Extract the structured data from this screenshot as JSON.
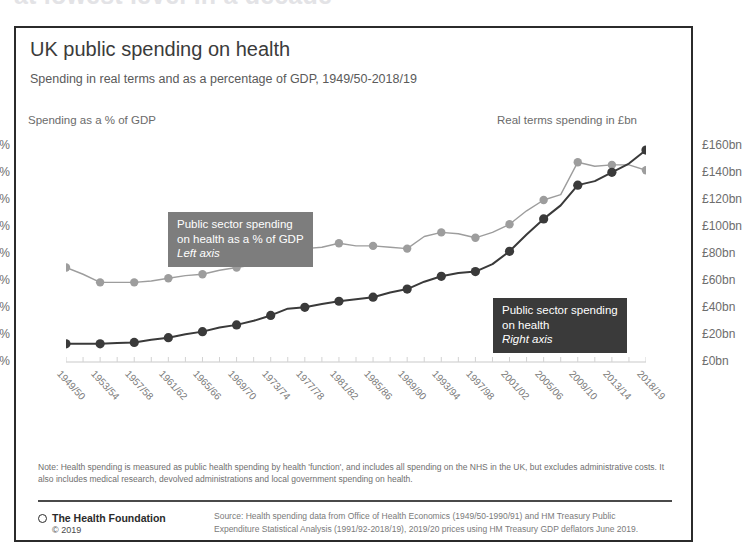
{
  "headline": "at lowest level in a decade",
  "card": {
    "title": "UK public spending on health",
    "subtitle": "Spending in real terms and as a percentage of GDP, 1949/50-2018/19",
    "left_axis_caption": "Spending as a % of GDP",
    "right_axis_caption": "Real terms spending in £bn",
    "callouts": {
      "gdp": {
        "line1": "Public sector spending",
        "line2": "on health as a % of GDP",
        "axis_note": "Left axis",
        "color": "#7d7d7d"
      },
      "real": {
        "line1": "Public sector spending",
        "line2": "on health",
        "axis_note": "Right axis",
        "color": "#3a3a3a"
      }
    },
    "note": "Note: Health spending is measured as public health spending by health 'function', and includes all spending on the NHS in the UK, but excludes administrative costs. It also includes medical research, devolved administrations and local government spending on health.",
    "brand": "The Health Foundation",
    "copyright": "© 2019",
    "source": "Source: Health spending data from Office of Health Economics (1949/50-1990/91) and HM Treasury Public Expenditure Statistical Analysis (1991/92-2018/19), 2019/20 prices using HM Treasury GDP deflators June 2019."
  },
  "chart_data": {
    "type": "line",
    "title": "UK public spending on health",
    "subtitle": "Spending in real terms and as a percentage of GDP, 1949/50-2018/19",
    "xlabel": "",
    "ylabel": "Spending as a % of GDP",
    "y2label": "Real terms spending in £bn",
    "grid": false,
    "legend_position": "inline-callout",
    "ylim": [
      0,
      8
    ],
    "y2lim": [
      0,
      160
    ],
    "yticks": [
      "0%",
      "1%",
      "2%",
      "3%",
      "4%",
      "5%",
      "6%",
      "7%",
      "8%"
    ],
    "y2ticks": [
      "£0bn",
      "£20bn",
      "£40bn",
      "£60bn",
      "£80bn",
      "£100bn",
      "£120bn",
      "£140bn",
      "£160bn"
    ],
    "xtick_labels": [
      "1949/50",
      "1953/54",
      "1957/58",
      "1961/62",
      "1965/66",
      "1969/70",
      "1973/74",
      "1977/78",
      "1981/82",
      "1985/86",
      "1989/90",
      "1993/94",
      "1997/98",
      "2001/02",
      "2005/06",
      "2009/10",
      "2013/14",
      "2018/19"
    ],
    "x": [
      "1949/50",
      "1951/52",
      "1953/54",
      "1955/56",
      "1957/58",
      "1959/60",
      "1961/62",
      "1963/64",
      "1965/66",
      "1967/68",
      "1969/70",
      "1971/72",
      "1973/74",
      "1975/76",
      "1977/78",
      "1979/80",
      "1981/82",
      "1983/84",
      "1985/86",
      "1987/88",
      "1989/90",
      "1991/92",
      "1993/94",
      "1995/96",
      "1997/98",
      "1999/00",
      "2001/02",
      "2003/04",
      "2005/06",
      "2007/08",
      "2009/10",
      "2011/12",
      "2013/14",
      "2015/16",
      "2018/19"
    ],
    "series": [
      {
        "name": "Public sector spending on health as a % of GDP",
        "axis": "left",
        "unit": "% of GDP",
        "color": "#9d9d9d",
        "values": [
          3.5,
          3.25,
          2.95,
          2.95,
          2.95,
          3.0,
          3.1,
          3.2,
          3.25,
          3.4,
          3.5,
          3.6,
          3.95,
          4.3,
          4.2,
          4.25,
          4.4,
          4.3,
          4.3,
          4.25,
          4.2,
          4.65,
          4.8,
          4.75,
          4.6,
          4.8,
          5.1,
          5.6,
          6.0,
          6.2,
          7.4,
          7.25,
          7.3,
          7.3,
          7.1
        ]
      },
      {
        "name": "Public sector spending on health",
        "axis": "right",
        "unit": "£bn",
        "color": "#3a3a3a",
        "values": [
          13.5,
          13.5,
          13.5,
          14.0,
          14.5,
          16.5,
          18.0,
          20.5,
          22.5,
          25.5,
          27.5,
          30.5,
          34.5,
          39.5,
          40.5,
          43.0,
          45.0,
          46.5,
          48.0,
          51.5,
          54.0,
          59.5,
          63.5,
          66.0,
          67.0,
          72.5,
          82.0,
          94.5,
          106.0,
          116.0,
          131.0,
          134.0,
          140.5,
          147.0,
          157.0
        ]
      }
    ]
  }
}
